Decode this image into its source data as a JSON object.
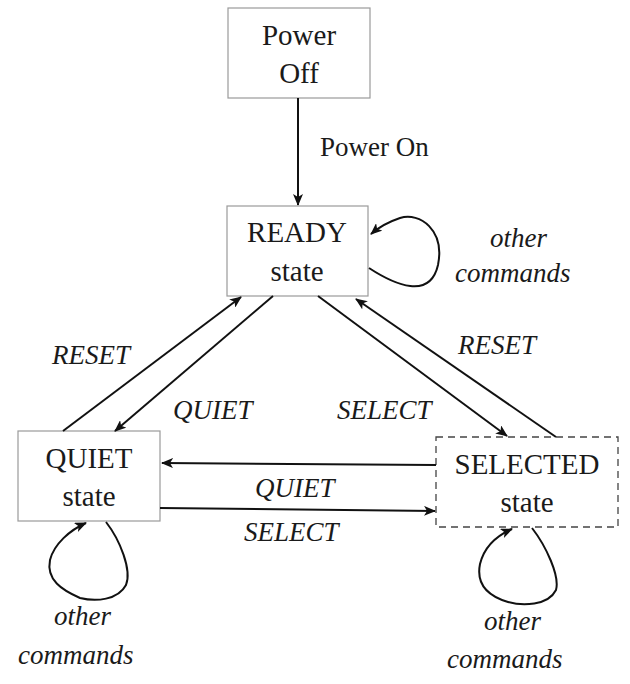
{
  "diagram": {
    "type": "state-machine",
    "states": [
      {
        "id": "power_off",
        "line1": "Power",
        "line2": "Off",
        "border": "solid"
      },
      {
        "id": "ready",
        "line1": "READY",
        "line2": "state",
        "border": "solid"
      },
      {
        "id": "quiet",
        "line1": "QUIET",
        "line2": "state",
        "border": "solid"
      },
      {
        "id": "selected",
        "line1": "SELECTED",
        "line2": "state",
        "border": "dashed"
      }
    ],
    "transitions": [
      {
        "from": "power_off",
        "to": "ready",
        "label": "Power On"
      },
      {
        "from": "ready",
        "to": "ready",
        "label_line1": "other",
        "label_line2": "commands"
      },
      {
        "from": "quiet",
        "to": "ready",
        "label": "RESET"
      },
      {
        "from": "ready",
        "to": "quiet",
        "label": "QUIET"
      },
      {
        "from": "ready",
        "to": "selected",
        "label": "SELECT"
      },
      {
        "from": "selected",
        "to": "ready",
        "label": "RESET"
      },
      {
        "from": "selected",
        "to": "quiet",
        "label": "QUIET"
      },
      {
        "from": "quiet",
        "to": "selected",
        "label": "SELECT"
      },
      {
        "from": "quiet",
        "to": "quiet",
        "label_line1": "other",
        "label_line2": "commands"
      },
      {
        "from": "selected",
        "to": "selected",
        "label_line1": "other",
        "label_line2": "commands"
      }
    ]
  }
}
